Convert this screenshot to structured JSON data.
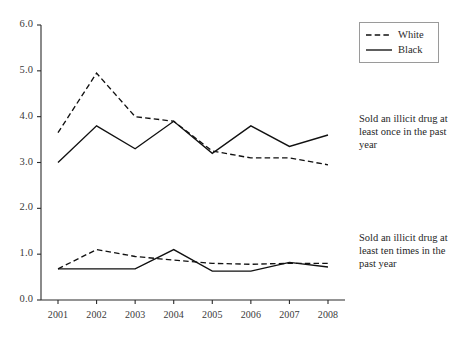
{
  "chart_data": {
    "type": "line",
    "title": "",
    "subtitle": "",
    "xlabel": "",
    "ylabel": "",
    "x": [
      2001,
      2002,
      2003,
      2004,
      2005,
      2006,
      2007,
      2008
    ],
    "categories": [
      "2001",
      "2002",
      "2003",
      "2004",
      "2005",
      "2006",
      "2007",
      "2008"
    ],
    "xlim": [
      2000.6,
      2008.4
    ],
    "ylim": [
      0.0,
      6.0
    ],
    "yticks": [
      0.0,
      1.0,
      2.0,
      3.0,
      4.0,
      5.0,
      6.0
    ],
    "ytick_labels": [
      "0.0",
      "1.0",
      "2.0",
      "3.0",
      "4.0",
      "5.0",
      "6.0"
    ],
    "xtick_labels": [
      "2001",
      "2002",
      "2003",
      "2004",
      "2005",
      "2006",
      "2007",
      "2008"
    ],
    "grid": false,
    "legend_position": "top-right",
    "legend_entries": [
      "White",
      "Black"
    ],
    "groups": [
      {
        "name": "Sold an illicit drug at least once in the past year",
        "series": [
          {
            "name": "White",
            "style": "dashed",
            "values": [
              3.65,
              4.95,
              4.0,
              3.9,
              3.25,
              3.1,
              3.1,
              2.95
            ]
          },
          {
            "name": "Black",
            "style": "solid",
            "values": [
              3.0,
              3.8,
              3.3,
              3.9,
              3.2,
              3.8,
              3.35,
              3.6
            ]
          }
        ]
      },
      {
        "name": "Sold an illicit drug at least ten times in the past year",
        "series": [
          {
            "name": "White",
            "style": "dashed",
            "values": [
              0.68,
              1.1,
              0.95,
              0.87,
              0.8,
              0.78,
              0.8,
              0.8
            ]
          },
          {
            "name": "Black",
            "style": "solid",
            "values": [
              0.68,
              0.68,
              0.68,
              1.1,
              0.63,
              0.63,
              0.82,
              0.72
            ]
          }
        ]
      }
    ],
    "series": [
      {
        "name": "White - sold once in past year",
        "style": "dashed",
        "values": [
          3.65,
          4.95,
          4.0,
          3.9,
          3.25,
          3.1,
          3.1,
          2.95
        ]
      },
      {
        "name": "Black - sold once in past year",
        "style": "solid",
        "values": [
          3.0,
          3.8,
          3.3,
          3.9,
          3.2,
          3.8,
          3.35,
          3.6
        ]
      },
      {
        "name": "White - sold ten times in past year",
        "style": "dashed",
        "values": [
          0.68,
          1.1,
          0.95,
          0.87,
          0.8,
          0.78,
          0.8,
          0.8
        ]
      },
      {
        "name": "Black - sold ten times in past year",
        "style": "solid",
        "values": [
          0.68,
          0.68,
          0.68,
          1.1,
          0.63,
          0.63,
          0.82,
          0.72
        ]
      }
    ],
    "annotations": [
      {
        "id": "once",
        "text": "Sold an illicit drug at least once in the past year"
      },
      {
        "id": "ten",
        "text": "Sold an illicit drug at least ten times in the past year"
      }
    ]
  },
  "legend": {
    "white_label": "White",
    "black_label": "Black"
  },
  "annotations": {
    "once": "Sold an illicit drug at least once in the past year",
    "ten": "Sold an illicit drug at least ten times in the past year"
  },
  "colors": {
    "line": "#111111",
    "axis": "#2b2b2b",
    "text": "#1f1f1f",
    "background": "#ffffff"
  }
}
